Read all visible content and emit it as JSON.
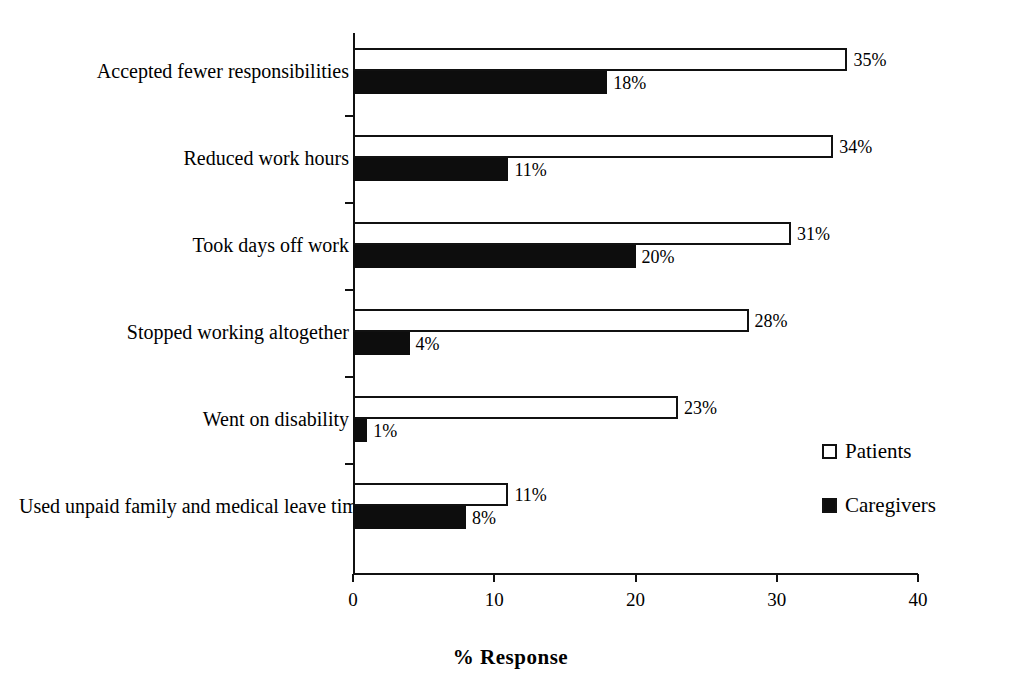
{
  "chart_data": {
    "type": "bar",
    "orientation": "horizontal",
    "title": "",
    "xlabel": "% Response",
    "ylabel": "",
    "xlim": [
      0,
      40
    ],
    "xticks": [
      0,
      10,
      20,
      30,
      40
    ],
    "xtick_labels": [
      "0",
      "10",
      "20",
      "30",
      "40"
    ],
    "grid": false,
    "legend_position": "right",
    "categories": [
      "Accepted fewer responsibilities",
      "Reduced work hours",
      "Took days off work",
      "Stopped working altogether",
      "Went on disability",
      "Used unpaid family and medical leave time"
    ],
    "series": [
      {
        "name": "Patients",
        "color": "#ffffff",
        "edge_color": "#111111",
        "values": [
          35,
          34,
          31,
          28,
          23,
          11
        ],
        "value_labels": [
          "35%",
          "34%",
          "31%",
          "28%",
          "23%",
          "11%"
        ]
      },
      {
        "name": "Caregivers",
        "color": "#0d0d0d",
        "edge_color": "#0d0d0d",
        "values": [
          18,
          11,
          20,
          4,
          1,
          8
        ],
        "value_labels": [
          "18%",
          "11%",
          "20%",
          "4%",
          "1%",
          "8%"
        ]
      }
    ]
  },
  "legend": {
    "items": [
      {
        "label": "Patients",
        "swatch": "hollow"
      },
      {
        "label": "Caregivers",
        "swatch": "filled"
      }
    ]
  },
  "axis": {
    "x_title": "% Response"
  }
}
